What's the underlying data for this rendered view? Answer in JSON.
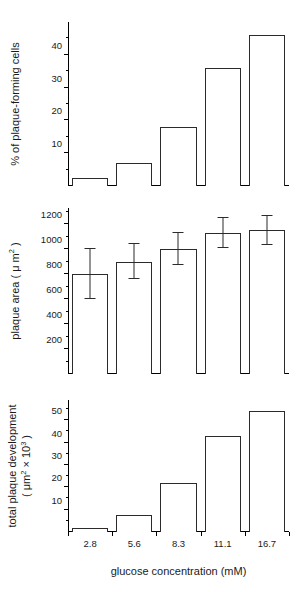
{
  "figure": {
    "xaxis_title": "glucose concentration (mM)",
    "categories": [
      "2.8",
      "5.6",
      "8.3",
      "11.1",
      "16.7"
    ]
  },
  "chart_data": [
    {
      "type": "bar",
      "panel": "top",
      "title": "",
      "xlabel": "glucose concentration (mM)",
      "ylabel": "% of plaque-forming cells",
      "categories": [
        "2.8",
        "5.6",
        "8.3",
        "11.1",
        "16.7"
      ],
      "values": [
        2.5,
        7,
        18,
        36,
        46
      ],
      "ylim": [
        0,
        50
      ],
      "yticks": [
        10,
        20,
        30,
        40
      ],
      "ytick_labels": [
        "10",
        "20",
        "30",
        "40"
      ],
      "yminor_ticks": [
        5,
        15,
        25,
        35,
        45
      ],
      "grid": false,
      "legend": "none",
      "bar_fill": "#ffffff",
      "bar_edge": "#2b2b2b"
    },
    {
      "type": "bar",
      "panel": "middle",
      "title": "",
      "xlabel": "glucose concentration (mM)",
      "ylabel": "plaque area ( μm² )",
      "categories": [
        "2.8",
        "5.6",
        "8.3",
        "11.1",
        "16.7"
      ],
      "values": [
        800,
        900,
        1000,
        1130,
        1150
      ],
      "errors": [
        200,
        140,
        130,
        120,
        115
      ],
      "ylim": [
        0,
        1330
      ],
      "yticks": [
        200,
        400,
        600,
        800,
        1000,
        1200
      ],
      "ytick_labels": [
        "200",
        "400",
        "600",
        "800",
        "1000",
        "1200"
      ],
      "yminor_ticks": [
        100,
        300,
        500,
        700,
        900,
        1100,
        1300
      ],
      "grid": false,
      "legend": "none",
      "bar_fill": "#ffffff",
      "bar_edge": "#2b2b2b",
      "error_color": "#2b2b2b"
    },
    {
      "type": "bar",
      "panel": "bottom",
      "title": "",
      "xlabel": "glucose concentration (mM)",
      "ylabel": "total plaque development ( μm² × 10³ )",
      "categories": [
        "2.8",
        "5.6",
        "8.3",
        "11.1",
        "16.7"
      ],
      "values": [
        2,
        7.5,
        22,
        43,
        54
      ],
      "ylim": [
        0,
        59
      ],
      "yticks": [
        10,
        20,
        30,
        40,
        50
      ],
      "ytick_labels": [
        "10",
        "20",
        "30",
        "40",
        "50"
      ],
      "yminor_ticks": [
        5,
        15,
        25,
        35,
        45,
        55
      ],
      "grid": false,
      "legend": "none",
      "bar_fill": "#ffffff",
      "bar_edge": "#2b2b2b"
    }
  ],
  "labels": {
    "ylabel_top": "% of plaque-forming cells",
    "ylabel_middle_pre": "plaque area ( μ m",
    "ylabel_middle_sup": "2",
    "ylabel_middle_post": " )",
    "ylabel_bottom_line1": "total plaque development",
    "ylabel_bottom_line2_pre": "( μm",
    "ylabel_bottom_line2_sup1": "2",
    "ylabel_bottom_line2_mid": " × 10",
    "ylabel_bottom_line2_sup2": "3",
    "ylabel_bottom_line2_post": " )"
  }
}
